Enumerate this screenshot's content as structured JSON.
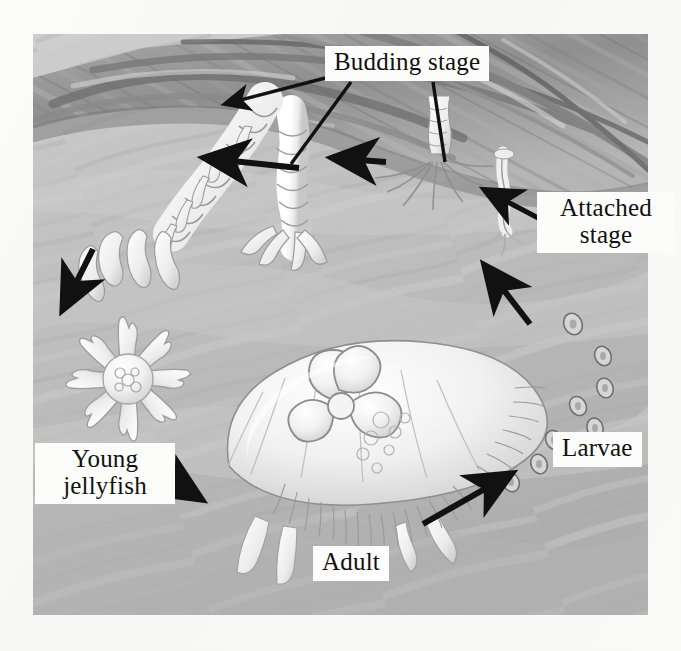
{
  "figure": {
    "medium": "grayscale pencil illustration",
    "background_color": "#c9c9c9",
    "label_box_color": "#fcfcfa",
    "ink_color": "#111111"
  },
  "labels": {
    "budding": "Budding stage",
    "attached": "Attached\nstage",
    "young": "Young\njellyfish",
    "larvae": "Larvae",
    "adult": "Adult"
  },
  "stages": [
    {
      "id": "attached",
      "name": "Attached stage",
      "description": "small scyphistoma polyp attached beneath the rock ledge with slender tentacles"
    },
    {
      "id": "budding",
      "name": "Budding stage",
      "description": "strobila polyps with stacked segmented discs budding off ephyrae"
    },
    {
      "id": "young",
      "name": "Young jellyfish",
      "description": "eight-armed ephyra with notched arm tips drifting free"
    },
    {
      "id": "adult",
      "name": "Adult",
      "description": "mature moon jelly medusa with four-lobed clover gonads and fringe of tentacles"
    },
    {
      "id": "larvae",
      "name": "Larvae",
      "description": "chain of small oval planula larvae drifting toward the rock"
    }
  ],
  "cycle_arrows": [
    {
      "from": "adult",
      "to": "larvae",
      "direction": "up-right"
    },
    {
      "from": "larvae",
      "to": "attached",
      "direction": "up-left"
    },
    {
      "from": "attached",
      "to": "budding-right",
      "direction": "left"
    },
    {
      "from": "budding-right",
      "to": "budding-middle",
      "direction": "left"
    },
    {
      "from": "budding-middle",
      "to": "budding-left",
      "direction": "left"
    },
    {
      "from": "budding-left",
      "to": "young",
      "direction": "down-left"
    },
    {
      "from": "young",
      "to": "adult",
      "direction": "down-right"
    }
  ],
  "leader_lines": [
    {
      "label": "budding",
      "target": "strobila-left",
      "has_arrowhead": true
    },
    {
      "label": "budding",
      "target": "strobila-middle",
      "has_arrowhead": false
    },
    {
      "label": "budding",
      "target": "polyp-right",
      "has_arrowhead": false
    },
    {
      "label": "attached",
      "target": "attached-polyp",
      "has_arrowhead": true
    },
    {
      "label": "young",
      "target": "ephyra",
      "has_arrowhead": false
    },
    {
      "label": "larvae",
      "target": "planula-chain",
      "has_arrowhead": false
    },
    {
      "label": "adult",
      "target": "medusa",
      "has_arrowhead": false
    }
  ]
}
